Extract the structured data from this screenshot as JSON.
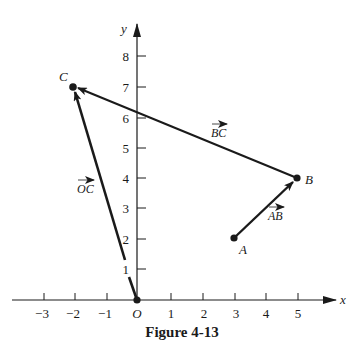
{
  "figure": {
    "caption": "Figure 4-13",
    "axes": {
      "x_label": "x",
      "y_label": "y",
      "origin_label": "O",
      "x_ticks": [
        {
          "value": -3,
          "label": "−3"
        },
        {
          "value": -2,
          "label": "−2"
        },
        {
          "value": -1,
          "label": "−1"
        },
        {
          "value": 1,
          "label": "1"
        },
        {
          "value": 2,
          "label": "2"
        },
        {
          "value": 3,
          "label": "3"
        },
        {
          "value": 4,
          "label": "4"
        },
        {
          "value": 5,
          "label": "5"
        }
      ],
      "y_ticks": [
        {
          "value": 1,
          "label": "1"
        },
        {
          "value": 2,
          "label": "2"
        },
        {
          "value": 3,
          "label": "3"
        },
        {
          "value": 4,
          "label": "4"
        },
        {
          "value": 5,
          "label": "5"
        },
        {
          "value": 6,
          "label": "6"
        },
        {
          "value": 7,
          "label": "7"
        },
        {
          "value": 8,
          "label": "8"
        }
      ]
    },
    "points": [
      {
        "name": "O",
        "x": 0,
        "y": 0
      },
      {
        "name": "A",
        "x": 3,
        "y": 2
      },
      {
        "name": "B",
        "x": 5,
        "y": 4
      },
      {
        "name": "C",
        "x": -2,
        "y": 7
      }
    ],
    "vectors": [
      {
        "label": "OC",
        "from": "O",
        "to": "C"
      },
      {
        "label": "AB",
        "from": "A",
        "to": "B"
      },
      {
        "label": "BC",
        "from": "B",
        "to": "C"
      }
    ],
    "colors": {
      "ink": "#1a1a1a",
      "background": "#ffffff"
    }
  }
}
